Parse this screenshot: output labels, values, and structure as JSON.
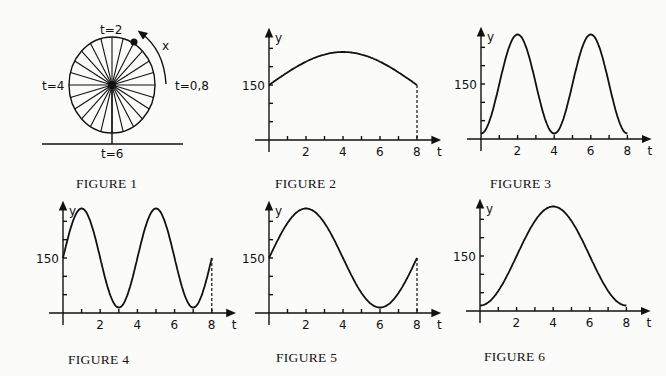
{
  "figure1": {
    "caption": "FIGURE 1",
    "labels": {
      "top": "t=2",
      "left": "t=4",
      "right": "t=0,8",
      "bottom": "t=6",
      "arrow": "x"
    },
    "spokes": 24
  },
  "figures": [
    {
      "id": "fig2",
      "caption": "FIGURE 2",
      "ylabel": "y",
      "xlabel": "t",
      "y_tick_label": "150",
      "x_tick_labels": [
        "2",
        "4",
        "6",
        "8"
      ],
      "dashed_end": true
    },
    {
      "id": "fig3",
      "caption": "FIGURE 3",
      "ylabel": "y",
      "xlabel": "t",
      "y_tick_label": "150",
      "x_tick_labels": [
        "2",
        "4",
        "6",
        "8"
      ],
      "dashed_end": false
    },
    {
      "id": "fig4",
      "caption": "FIGURE 4",
      "ylabel": "y",
      "xlabel": "t",
      "y_tick_label": "150",
      "x_tick_labels": [
        "2",
        "4",
        "6",
        "8"
      ],
      "dashed_end": true
    },
    {
      "id": "fig5",
      "caption": "FIGURE 5",
      "ylabel": "y",
      "xlabel": "t",
      "y_tick_label": "150",
      "x_tick_labels": [
        "2",
        "4",
        "6",
        "8"
      ],
      "dashed_end": true
    },
    {
      "id": "fig6",
      "caption": "FIGURE 6",
      "ylabel": "y",
      "xlabel": "t",
      "y_tick_label": "150",
      "x_tick_labels": [
        "2",
        "4",
        "6",
        "8"
      ],
      "dashed_end": false
    }
  ],
  "chart_data": [
    {
      "type": "line",
      "title": "FIGURE 2",
      "xlabel": "t",
      "ylabel": "y",
      "x": [
        0,
        1,
        2,
        3,
        4,
        5,
        6,
        7,
        8
      ],
      "values": [
        150,
        185,
        215,
        235,
        240,
        235,
        215,
        185,
        150
      ],
      "xlim": [
        0,
        8
      ],
      "ytick_labeled": 150,
      "description": "single broad arch, starts and ends at 150, max at t=4"
    },
    {
      "type": "line",
      "title": "FIGURE 3",
      "xlabel": "t",
      "ylabel": "y",
      "x": [
        0,
        1,
        2,
        3,
        4,
        5,
        6,
        7,
        8
      ],
      "values": [
        15,
        150,
        285,
        150,
        15,
        150,
        285,
        150,
        15
      ],
      "xlim": [
        0,
        8
      ],
      "ytick_labeled": 150,
      "description": "two peaks at t=2,6; minima at t=0,4,8"
    },
    {
      "type": "line",
      "title": "FIGURE 4",
      "xlabel": "t",
      "ylabel": "y",
      "x": [
        0,
        1,
        2,
        3,
        4,
        5,
        6,
        7,
        8
      ],
      "values": [
        150,
        285,
        150,
        15,
        150,
        285,
        150,
        15,
        150
      ],
      "xlim": [
        0,
        8
      ],
      "ytick_labeled": 150,
      "description": "two periods, peaks t=1,5; troughs t=3,7"
    },
    {
      "type": "line",
      "title": "FIGURE 5",
      "xlabel": "t",
      "ylabel": "y",
      "x": [
        0,
        1,
        2,
        3,
        4,
        5,
        6,
        7,
        8
      ],
      "values": [
        150,
        245,
        285,
        245,
        150,
        55,
        15,
        55,
        150
      ],
      "xlim": [
        0,
        8
      ],
      "ytick_labeled": 150,
      "description": "one period sine, peak t=2, trough t=6"
    },
    {
      "type": "line",
      "title": "FIGURE 6",
      "xlabel": "t",
      "ylabel": "y",
      "x": [
        0,
        1,
        2,
        3,
        4,
        5,
        6,
        7,
        8
      ],
      "values": [
        15,
        55,
        150,
        245,
        285,
        245,
        150,
        55,
        15
      ],
      "xlim": [
        0,
        8
      ],
      "ytick_labeled": 150,
      "description": "one period inverted cosine, peak t=4"
    }
  ]
}
